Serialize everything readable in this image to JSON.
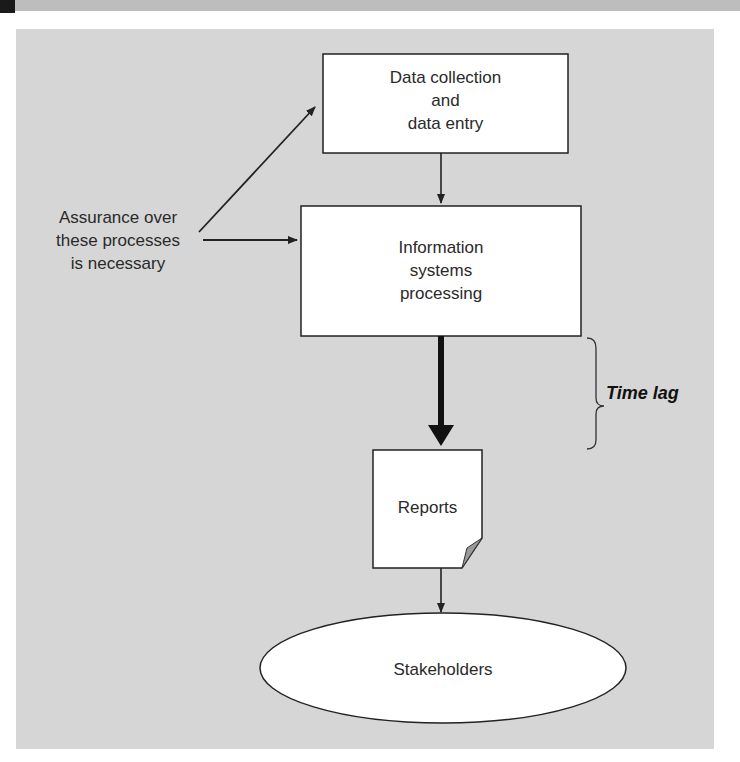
{
  "diagram": {
    "nodes": {
      "data_collection": {
        "label_lines": [
          "Data collection",
          "and",
          "data entry"
        ],
        "shape": "rectangle"
      },
      "is_processing": {
        "label_lines": [
          "Information",
          "systems",
          "processing"
        ],
        "shape": "rectangle"
      },
      "reports": {
        "label": "Reports",
        "shape": "document"
      },
      "stakeholders": {
        "label": "Stakeholders",
        "shape": "ellipse"
      }
    },
    "annotations": {
      "assurance": {
        "label_lines": [
          "Assurance over",
          "these processes",
          "is necessary"
        ]
      },
      "time_lag": {
        "label": "Time lag"
      }
    },
    "edges": [
      {
        "from": "assurance",
        "to": "data_collection"
      },
      {
        "from": "assurance",
        "to": "is_processing"
      },
      {
        "from": "data_collection",
        "to": "is_processing"
      },
      {
        "from": "is_processing",
        "to": "reports",
        "style": "thick"
      },
      {
        "from": "reports",
        "to": "stakeholders"
      }
    ],
    "colors": {
      "background": "#d6d6d6",
      "box_fill": "#ffffff",
      "stroke": "#222222",
      "fold": "#9a9a9a"
    }
  }
}
